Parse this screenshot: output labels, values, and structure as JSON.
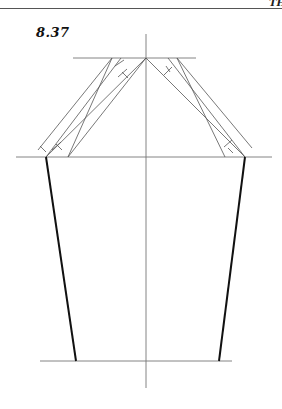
{
  "header": {
    "running_text": "TH"
  },
  "figure": {
    "label": "8.37",
    "colors": {
      "construction_line": "#777777",
      "outline": "#111111"
    },
    "points": {
      "apex": [
        146,
        58
      ],
      "left_corner": [
        46,
        157
      ],
      "right_corner": [
        245,
        157
      ],
      "left_hem": [
        76,
        361
      ],
      "right_hem": [
        219,
        361
      ]
    },
    "guide_lines": {
      "center_vertical": {
        "x": 146,
        "y1": 34,
        "y2": 388
      },
      "top_horizontal": {
        "y": 58,
        "x1": 73,
        "x2": 196
      },
      "bicep_horizontal": {
        "y": 157,
        "x1": 16,
        "x2": 272
      },
      "hem_horizontal": {
        "y": 361,
        "x1": 40,
        "x2": 232
      }
    }
  }
}
